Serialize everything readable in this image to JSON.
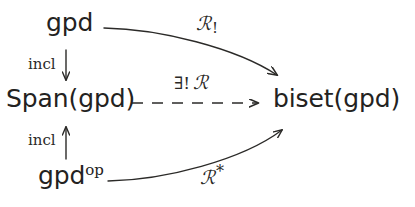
{
  "diagram": {
    "type": "commutative-diagram",
    "background_color": "#ffffff",
    "ink_color": "#232221",
    "nodes": [
      {
        "id": "gpd_top",
        "label": "gpd",
        "position": "top-left"
      },
      {
        "id": "span_gpd",
        "label": "Span(gpd)",
        "position": "middle-left"
      },
      {
        "id": "gpd_op",
        "label": "gpd",
        "superscript": "op",
        "position": "bottom-left"
      },
      {
        "id": "biset_gpd",
        "label": "biset(gpd)",
        "position": "middle-right"
      }
    ],
    "edges": [
      {
        "id": "incl_down",
        "label": "incl",
        "from": "gpd_top",
        "to": "span_gpd",
        "style": "solid",
        "direction": "down",
        "arrowhead": "open"
      },
      {
        "id": "incl_up",
        "label": "incl",
        "from": "gpd_op",
        "to": "span_gpd",
        "style": "solid",
        "direction": "up",
        "arrowhead": "open"
      },
      {
        "id": "R_shriek",
        "label_base": "ℛ",
        "label_mark": "!",
        "label_mark_kind": "subscript",
        "from": "gpd_top",
        "to": "biset_gpd",
        "style": "solid",
        "direction": "right",
        "curve": "bowed-up",
        "arrowhead": "open"
      },
      {
        "id": "R_star",
        "label_base": "ℛ",
        "label_mark": "*",
        "label_mark_kind": "superscript",
        "from": "gpd_op",
        "to": "biset_gpd",
        "style": "solid",
        "direction": "right",
        "curve": "bowed-down",
        "arrowhead": "open"
      },
      {
        "id": "exists_unique_R",
        "label_quantifier": "∃!",
        "label_base": "ℛ",
        "from": "span_gpd",
        "to": "biset_gpd",
        "style": "dashed",
        "direction": "right",
        "curve": "straight",
        "arrowhead": "open",
        "dash_count": 6
      }
    ]
  }
}
